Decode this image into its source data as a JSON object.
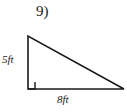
{
  "figure": {
    "problem_number": "9)",
    "shape": "right-triangle",
    "labels": {
      "vertical_leg": "5ft",
      "horizontal_leg": "8ft"
    },
    "measurements": {
      "vertical_leg_value": 5,
      "horizontal_leg_value": 8,
      "units": "ft"
    },
    "right_angle_marker": {
      "present": true,
      "vertex": "bottom-left"
    },
    "geometry": {
      "apex": [
        28,
        36
      ],
      "bottom_left": [
        28,
        89
      ],
      "bottom_right": [
        124,
        89
      ]
    },
    "colors": {
      "stroke": "#1a1a1a",
      "background": "#ffffff",
      "text": "#1a1a1a"
    }
  }
}
